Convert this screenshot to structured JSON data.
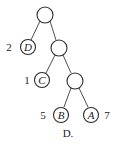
{
  "diagram": {
    "type": "binary-tree",
    "caption": "D.",
    "nodes": [
      {
        "id": "root",
        "letter": "",
        "weight": ""
      },
      {
        "id": "n1",
        "letter": "",
        "weight": ""
      },
      {
        "id": "n2",
        "letter": "",
        "weight": ""
      },
      {
        "id": "D",
        "letter": "D",
        "weight": "2"
      },
      {
        "id": "C",
        "letter": "C",
        "weight": "1"
      },
      {
        "id": "B",
        "letter": "B",
        "weight": "5"
      },
      {
        "id": "A",
        "letter": "A",
        "weight": "7"
      }
    ],
    "edges": [
      [
        "root",
        "D"
      ],
      [
        "root",
        "n1"
      ],
      [
        "n1",
        "C"
      ],
      [
        "n1",
        "n2"
      ],
      [
        "n2",
        "B"
      ],
      [
        "n2",
        "A"
      ]
    ]
  }
}
